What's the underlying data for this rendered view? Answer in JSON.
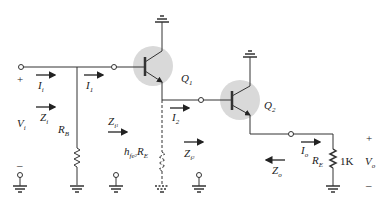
{
  "diagram": {
    "colors": {
      "wire": "#333333",
      "transistor_highlight": "#d9d9d9",
      "text": "#222222"
    },
    "labels": {
      "input_plus": "+",
      "input_minus": "–",
      "Vi": "V",
      "Vi_sub": "i",
      "Ii": "I",
      "Ii_sub": "i",
      "Zi": "Z",
      "Zi_sub": "i",
      "I1": "I",
      "I1_sub": "1",
      "RB": "R",
      "RB_sub": "B",
      "Q1": "Q",
      "Q1_sub": "1",
      "Zi1": "Z",
      "Zi1_sub": "i",
      "Zi1_sub2": "1",
      "hfe2RE": "h",
      "hfe2RE_sub": "fe",
      "hfe2RE_sub2": "2",
      "hfe2RE_R": "R",
      "hfe2RE_R_sub": "E",
      "I2": "I",
      "I2_sub": "2",
      "Zi2": "Z",
      "Zi2_sub": "i",
      "Zi2_sub2": "2",
      "Q2": "Q",
      "Q2_sub": "2",
      "Io": "I",
      "Io_sub": "o",
      "Zo": "Z",
      "Zo_sub": "o",
      "RE": "R",
      "RE_sub": "E",
      "RE_value": "1K",
      "Vo": "V",
      "Vo_sub": "o",
      "output_plus": "+",
      "output_minus": "–"
    },
    "components": [
      {
        "id": "Q1",
        "type": "npn-transistor"
      },
      {
        "id": "Q2",
        "type": "npn-transistor"
      },
      {
        "id": "RB",
        "type": "resistor"
      },
      {
        "id": "hfe2RE",
        "type": "resistor",
        "style": "dashed"
      },
      {
        "id": "RE",
        "type": "resistor",
        "value": "1K"
      }
    ]
  }
}
